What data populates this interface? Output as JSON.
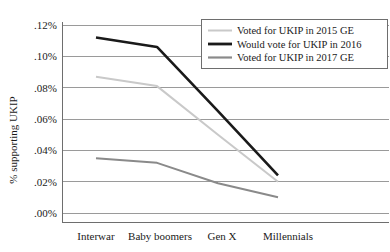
{
  "chart_data": {
    "type": "line",
    "title": "",
    "xlabel": "",
    "ylabel": "% supporting UKIP",
    "categories": [
      "Interwar",
      "Baby boomers",
      "Gen X",
      "Millennials"
    ],
    "ylim": [
      0.0,
      0.12
    ],
    "ytick_labels": [
      ".12%",
      ".10%",
      ".08%",
      ".06%",
      ".04%",
      ".02%",
      ".00%"
    ],
    "ytick_values": [
      0.12,
      0.1,
      0.08,
      0.06,
      0.04,
      0.02,
      0.0
    ],
    "grid": true,
    "legend_position": "top-right",
    "series": [
      {
        "name": "Voted for UKIP in 2015 GE",
        "color": "#c9c9c9",
        "width": 2.0,
        "values": [
          0.087,
          0.081,
          0.05,
          0.02
        ]
      },
      {
        "name": "Would vote for UKIP in 2016",
        "color": "#1a1a1a",
        "width": 2.6,
        "values": [
          0.112,
          0.106,
          0.065,
          0.024
        ]
      },
      {
        "name": "Voted for UKIP in 2017 GE",
        "color": "#8a8a8a",
        "width": 2.0,
        "values": [
          0.035,
          0.032,
          0.019,
          0.01
        ]
      }
    ]
  },
  "axis": {
    "y_title": "% supporting UKIP",
    "ticks_y": [
      ".12%",
      ".10%",
      ".08%",
      ".06%",
      ".04%",
      ".02%",
      ".00%"
    ],
    "ticks_x": [
      "Interwar",
      "Baby boomers",
      "Gen X",
      "Millennials"
    ]
  },
  "legend": {
    "items": [
      {
        "label": "Voted for UKIP in 2015 GE",
        "swatch": "line-swatch-light"
      },
      {
        "label": "Would vote for UKIP in 2016",
        "swatch": "line-swatch-black"
      },
      {
        "label": "Voted for UKIP in 2017 GE",
        "swatch": "line-swatch-gray"
      }
    ]
  }
}
